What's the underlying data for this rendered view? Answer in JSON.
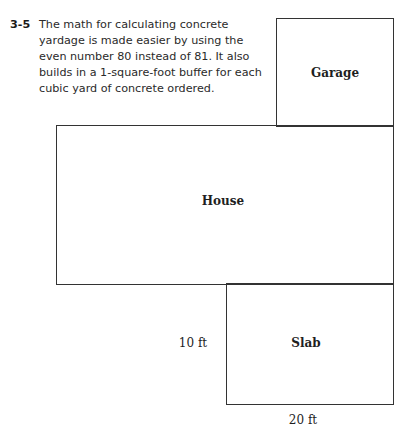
{
  "caption": {
    "figure_number": "3-5",
    "text": "The math for calculating concrete yardage is made easier by using the even number 80 instead of 81. It also builds in a 1-square-foot buffer for each cubic yard of concrete ordered."
  },
  "diagram": {
    "garage": {
      "label": "Garage"
    },
    "house": {
      "label": "House"
    },
    "slab": {
      "label": "Slab"
    },
    "dimensions": {
      "height": "10 ft",
      "width": "20 ft"
    }
  }
}
